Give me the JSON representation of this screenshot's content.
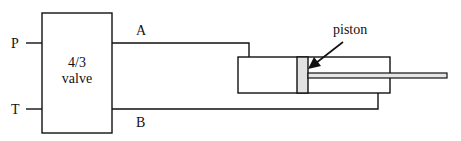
{
  "diagram": {
    "valve": {
      "line1": "4/3",
      "line2": "valve"
    },
    "ports": {
      "p": "P",
      "t": "T",
      "a": "A",
      "b": "B"
    },
    "piston_label": "piston",
    "colors": {
      "stroke": "#111111",
      "piston_fill": "#e2e2e2",
      "rod_fill": "#e6e6e6",
      "background": "#ffffff"
    }
  }
}
